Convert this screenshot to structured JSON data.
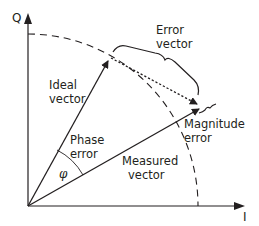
{
  "diagram": {
    "type": "IQ constellation error vector diagram",
    "axes": {
      "vertical_label": "Q",
      "horizontal_label": "I"
    },
    "labels": {
      "ideal_vector_line1": "Ideal",
      "ideal_vector_line2": "vector",
      "error_vector_line1": "Error",
      "error_vector_line2": "vector",
      "phase_error_line1": "Phase",
      "phase_error_line2": "error",
      "phase_symbol": "φ",
      "measured_vector_line1": "Measured",
      "measured_vector_line2": "vector",
      "magnitude_error_line1": "Magnitude",
      "magnitude_error_line2": "error"
    },
    "elements": [
      {
        "name": "ideal-vector",
        "style": "solid arrow"
      },
      {
        "name": "measured-vector",
        "style": "solid arrow"
      },
      {
        "name": "error-vector",
        "style": "dotted arrow"
      },
      {
        "name": "ideal-magnitude-circle",
        "style": "dashed arc"
      },
      {
        "name": "phase-angle-arc",
        "style": "thin arc"
      }
    ],
    "colors": {
      "ink": "#231f20",
      "background": "#ffffff"
    }
  }
}
